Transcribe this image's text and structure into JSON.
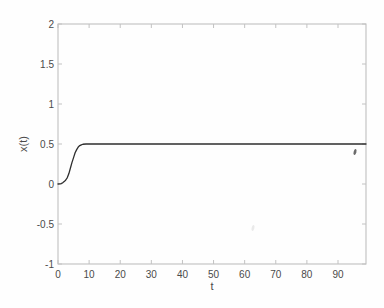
{
  "figure": {
    "background": "#fefefe",
    "axis_color": "#b9b9b9",
    "tick_color": "#c2c2c2",
    "label_color": "#4a4a4a"
  },
  "chart_data": {
    "type": "line",
    "title": "",
    "xlabel": "t",
    "ylabel": "x(t)",
    "xlim": [
      0,
      99
    ],
    "ylim": [
      -1,
      2
    ],
    "grid": false,
    "legend": "none",
    "xticks": [
      {
        "value": 0,
        "label": "0"
      },
      {
        "value": 10,
        "label": "10"
      },
      {
        "value": 20,
        "label": "20"
      },
      {
        "value": 30,
        "label": "30"
      },
      {
        "value": 40,
        "label": "40"
      },
      {
        "value": 50,
        "label": "50"
      },
      {
        "value": 60,
        "label": "60"
      },
      {
        "value": 70,
        "label": "70"
      },
      {
        "value": 80,
        "label": "80"
      },
      {
        "value": 90,
        "label": "90"
      }
    ],
    "yticks": [
      {
        "value": -1,
        "label": "-1"
      },
      {
        "value": -0.5,
        "label": "-0.5"
      },
      {
        "value": 0,
        "label": "0"
      },
      {
        "value": 0.5,
        "label": "0.5"
      },
      {
        "value": 1,
        "label": "1"
      },
      {
        "value": 1.5,
        "label": "1.5"
      },
      {
        "value": 2,
        "label": "2"
      }
    ],
    "series": [
      {
        "name": "x(t) trajectory",
        "color": "#2e2e2e",
        "width": 1.3,
        "points": [
          [
            0,
            0
          ],
          [
            0.5,
            0.002
          ],
          [
            1,
            0.006
          ],
          [
            1.5,
            0.015
          ],
          [
            2,
            0.03
          ],
          [
            2.5,
            0.05
          ],
          [
            3,
            0.08
          ],
          [
            3.5,
            0.13
          ],
          [
            4,
            0.2
          ],
          [
            4.5,
            0.27
          ],
          [
            5,
            0.33
          ],
          [
            5.5,
            0.39
          ],
          [
            6,
            0.43
          ],
          [
            6.5,
            0.462
          ],
          [
            7,
            0.48
          ],
          [
            7.5,
            0.49
          ],
          [
            8,
            0.497
          ],
          [
            9,
            0.5
          ],
          [
            10,
            0.5
          ],
          [
            99,
            0.5
          ]
        ]
      }
    ],
    "artifacts": [
      {
        "name": "dark-speck",
        "px": 355,
        "py": 152,
        "opacity": 0.75
      },
      {
        "name": "faint-smudge",
        "px": 253,
        "py": 228,
        "opacity": 0.1
      }
    ]
  }
}
